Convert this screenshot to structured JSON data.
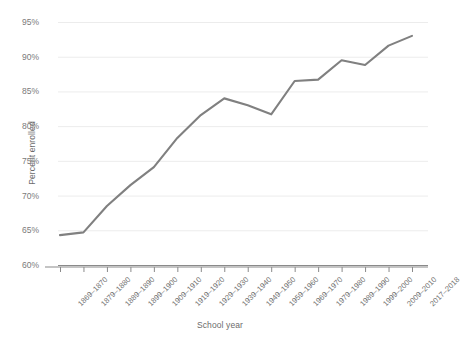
{
  "chart_data": {
    "type": "line",
    "title": "",
    "xlabel": "School year",
    "ylabel": "Percent enrolled",
    "ylim": [
      60,
      95
    ],
    "ytick_labels": [
      "95%",
      "90%",
      "85%",
      "80%",
      "75%",
      "70%",
      "65%",
      "60%"
    ],
    "ytick_values": [
      95,
      90,
      85,
      80,
      75,
      70,
      65,
      60
    ],
    "grid": true,
    "legend": "none",
    "line_color": "#808080",
    "grid_color": "#ececec",
    "axis_color": "#8a8a8a",
    "tick_label_color": "#7a7a7a",
    "categories": [
      "1869–1870",
      "1879–1880",
      "1889–1890",
      "1899–1900",
      "1909–1910",
      "1919–1920",
      "1929–1930",
      "1939–1940",
      "1949–1950",
      "1959–1960",
      "1969–1970",
      "1979–1980",
      "1989–1990",
      "1999–2000",
      "2009–2010",
      "2017–2018"
    ],
    "values": [
      64.3,
      64.7,
      68.5,
      71.5,
      74.1,
      78.3,
      81.6,
      84.0,
      83.0,
      81.7,
      86.5,
      86.7,
      89.5,
      88.8,
      91.6,
      93.0
    ],
    "series": [
      {
        "name": "Percent enrolled",
        "values": [
          64.3,
          64.7,
          68.5,
          71.5,
          74.1,
          78.3,
          81.6,
          84.0,
          83.0,
          81.7,
          86.5,
          86.7,
          89.5,
          88.8,
          91.6,
          93.0
        ]
      }
    ]
  }
}
